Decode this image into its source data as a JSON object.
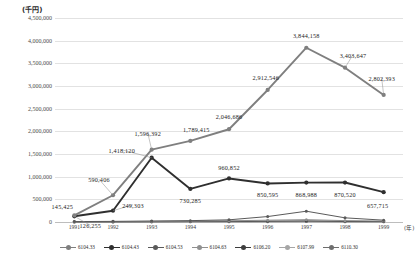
{
  "chart_data": {
    "type": "line",
    "title": "",
    "unit_label": "(千円)",
    "xlabel": "(年)",
    "ylabel": "",
    "x": [
      "1991",
      "1992",
      "1993",
      "1994",
      "1995",
      "1996",
      "1997",
      "1998",
      "1999"
    ],
    "ylim": [
      0,
      4500000
    ],
    "ytick_values": [
      0,
      500000,
      1000000,
      1500000,
      2000000,
      2500000,
      3000000,
      3500000,
      4000000,
      4500000
    ],
    "ytick_labels": [
      "0",
      "500,000",
      "1,000,000",
      "1,500,000",
      "2,000,000",
      "2,500,000",
      "3,000,000",
      "3,500,000",
      "4,000,000",
      "4,500,000"
    ],
    "grid": true,
    "legend_position": "bottom",
    "series": [
      {
        "name": "6104.33",
        "color": "#7f7f7f",
        "values": [
          145425,
          590406,
          1596392,
          1789415,
          2046686,
          2912546,
          3844158,
          3403647,
          2802393
        ]
      },
      {
        "name": "6104.43",
        "color": "#2f2f2f",
        "values": [
          126255,
          249303,
          1418120,
          730285,
          960852,
          850595,
          868988,
          870520,
          657715
        ]
      },
      {
        "name": "6104.53",
        "color": "#5a5a5a",
        "values": [
          9000,
          14000,
          22000,
          30000,
          48000,
          120000,
          238000,
          92000,
          40000
        ]
      },
      {
        "name": "6104.63",
        "color": "#909090",
        "values": [
          6000,
          9000,
          13000,
          18000,
          26000,
          40000,
          52000,
          30000,
          20000
        ]
      },
      {
        "name": "6106.20",
        "color": "#3d3d3d",
        "values": [
          4000,
          6000,
          8000,
          11000,
          15000,
          19000,
          24000,
          16000,
          11000
        ]
      },
      {
        "name": "6107.99",
        "color": "#a6a6a6",
        "values": [
          2500,
          4000,
          5500,
          7000,
          9000,
          12000,
          15000,
          10000,
          7000
        ]
      },
      {
        "name": "6110.30",
        "color": "#6e6e6e",
        "values": [
          1500,
          2200,
          3000,
          4200,
          5500,
          7000,
          9000,
          6000,
          4000
        ]
      }
    ],
    "data_labels": [
      {
        "series": "6104.33",
        "x": "1991",
        "text": "145,425",
        "dx": -12,
        "dy": -9
      },
      {
        "series": "6104.33",
        "x": "1992",
        "text": "590,406",
        "dx": -14,
        "dy": -16
      },
      {
        "series": "6104.33",
        "x": "1993",
        "text": "1,596,392",
        "dx": -4,
        "dy": -17
      },
      {
        "series": "6104.33",
        "x": "1994",
        "text": "1,789,415",
        "dx": 6,
        "dy": -12
      },
      {
        "series": "6104.33",
        "x": "1995",
        "text": "2,046,686",
        "dx": 0,
        "dy": -13
      },
      {
        "series": "6104.33",
        "x": "1996",
        "text": "2,912,546",
        "dx": -2,
        "dy": -13
      },
      {
        "series": "6104.33",
        "x": "1997",
        "text": "3,844,158",
        "dx": 0,
        "dy": -13
      },
      {
        "series": "6104.33",
        "x": "1998",
        "text": "3,403,647",
        "dx": 8,
        "dy": -13
      },
      {
        "series": "6104.33",
        "x": "1999",
        "text": "2,802,393",
        "dx": -2,
        "dy": -17
      },
      {
        "series": "6104.43",
        "x": "1991",
        "text": "126,255",
        "dx": 16,
        "dy": 9
      },
      {
        "series": "6104.43",
        "x": "1992",
        "text": "249,303",
        "dx": 20,
        "dy": -6
      },
      {
        "series": "6104.43",
        "x": "1993",
        "text": "1,418,120",
        "dx": -30,
        "dy": -8
      },
      {
        "series": "6104.43",
        "x": "1994",
        "text": "730,285",
        "dx": 0,
        "dy": 11
      },
      {
        "series": "6104.43",
        "x": "1995",
        "text": "960,852",
        "dx": 0,
        "dy": -11
      },
      {
        "series": "6104.43",
        "x": "1996",
        "text": "850,595",
        "dx": 0,
        "dy": 11
      },
      {
        "series": "6104.43",
        "x": "1997",
        "text": "868,988",
        "dx": 0,
        "dy": 11
      },
      {
        "series": "6104.43",
        "x": "1998",
        "text": "870,520",
        "dx": 0,
        "dy": 11
      },
      {
        "series": "6104.43",
        "x": "1999",
        "text": "657,715",
        "dx": -6,
        "dy": 13
      }
    ],
    "leader_lines": [
      {
        "series": "6104.33",
        "x": "1992",
        "dx": -14,
        "dy": -16
      },
      {
        "series": "6104.33",
        "x": "1993",
        "dx": -4,
        "dy": -17
      },
      {
        "series": "6104.33",
        "x": "1999",
        "dx": -2,
        "dy": -17
      },
      {
        "series": "6104.33",
        "x": "1998",
        "dx": 8,
        "dy": -13
      },
      {
        "series": "6104.43",
        "x": "1993",
        "dx": -30,
        "dy": -8
      },
      {
        "series": "6104.43",
        "x": "1992",
        "dx": 20,
        "dy": -6
      },
      {
        "series": "6104.43",
        "x": "1991",
        "dx": 16,
        "dy": 9
      }
    ]
  }
}
